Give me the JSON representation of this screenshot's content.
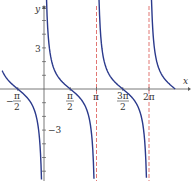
{
  "chart_data": {
    "type": "line",
    "title": "",
    "function": "y = cot x",
    "xlabel": "x",
    "ylabel": "y",
    "x_ticks": [
      {
        "value": -1.5708,
        "label": "-π/2"
      },
      {
        "value": 1.5708,
        "label": "π/2"
      },
      {
        "value": 3.1416,
        "label": "π"
      },
      {
        "value": 4.7124,
        "label": "3π/2"
      },
      {
        "value": 6.2832,
        "label": "2π"
      }
    ],
    "y_ticks": [
      {
        "value": 3,
        "label": "3"
      },
      {
        "value": -3,
        "label": "-3"
      }
    ],
    "xlim": [
      -2.6,
      8.0
    ],
    "ylim": [
      -6.5,
      6.5
    ],
    "asymptotes": [
      0,
      3.1416,
      6.2832
    ],
    "asymptote_style": {
      "color": "#d9534f",
      "dash": true
    },
    "series": [
      {
        "name": "cot x",
        "color": "#2b3a8c",
        "x": [
          -2.5,
          -1.5708,
          -1.0,
          -0.5,
          -0.15
        ],
        "y": [
          1.34,
          0,
          -0.64,
          -1.83,
          -6.6
        ]
      },
      {
        "name": "cot x",
        "color": "#2b3a8c",
        "x": [
          0.15,
          0.5,
          1.0,
          1.5708,
          2.14,
          2.64,
          2.99
        ],
        "y": [
          6.6,
          1.83,
          0.64,
          0,
          -0.64,
          -1.83,
          -6.6
        ]
      },
      {
        "name": "cot x",
        "color": "#2b3a8c",
        "x": [
          3.29,
          3.64,
          4.14,
          4.7124,
          5.28,
          5.78,
          6.13
        ],
        "y": [
          6.6,
          1.83,
          0.64,
          0,
          -0.64,
          -1.83,
          -6.6
        ]
      },
      {
        "name": "cot x",
        "color": "#2b3a8c",
        "x": [
          6.43,
          6.78,
          7.28,
          7.85
        ],
        "y": [
          6.6,
          1.83,
          0.64,
          0
        ]
      }
    ],
    "grid": false,
    "legend": null
  },
  "labels": {
    "x_axis": "x",
    "y_axis": "y",
    "tick_neg_pi_half_num": "π",
    "tick_neg_pi_half_den": "2",
    "tick_neg_sign": "−",
    "tick_pi_half_num": "π",
    "tick_pi_half_den": "2",
    "tick_pi": "π",
    "tick_3pi_half_num": "3π",
    "tick_3pi_half_den": "2",
    "tick_2pi": "2π",
    "tick_y_pos": "3",
    "tick_y_neg": "−3"
  }
}
